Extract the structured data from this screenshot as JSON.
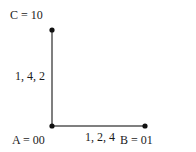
{
  "diagram": {
    "nodes": [
      {
        "id": "A",
        "label": "A = 00",
        "x": 52,
        "y": 126
      },
      {
        "id": "B",
        "label": "B = 01",
        "x": 145,
        "y": 126
      },
      {
        "id": "C",
        "label": "C = 10",
        "x": 52,
        "y": 30
      }
    ],
    "edges": [
      {
        "from": "A",
        "to": "C",
        "label": "1, 4, 2"
      },
      {
        "from": "A",
        "to": "B",
        "label": "1, 2, 4"
      }
    ],
    "colors": {
      "line": "#555555",
      "dot": "#111111",
      "text": "#1a1a1a"
    }
  }
}
